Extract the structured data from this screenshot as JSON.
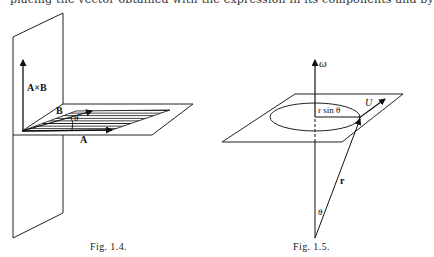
{
  "page": {
    "clipped_top_line": "placing the vector obtained with the expression in its components and by"
  },
  "figures": [
    {
      "id": "fig-1-4",
      "caption": "Fig. 1.4.",
      "labels": {
        "cross_product": "A×B",
        "vector_a": "A",
        "vector_b": "B",
        "angle": "θ"
      },
      "description": "Vector A and B spanning a shaded parallelogram in a horizontal plane, with A×B perpendicular in a vertical plane"
    },
    {
      "id": "fig-1-5",
      "caption": "Fig. 1.5.",
      "labels": {
        "omega": "ω",
        "radius_component": "r sin θ",
        "velocity": "U",
        "position": "r",
        "angle": "θ"
      },
      "description": "Rotation about axis ω; point at position r moves on circle of radius r sin θ with velocity U"
    }
  ]
}
